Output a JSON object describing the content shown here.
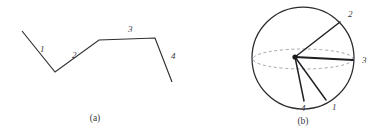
{
  "figure": {
    "background_color": "#ffffff",
    "stroke_color": "#2e2e33",
    "dashed_color": "#9b9ba3",
    "panels": [
      {
        "id": "panel-a",
        "caption": "(a)",
        "caption_x": 95,
        "caption_y": 121,
        "type": "polyline",
        "description": "Open polyline with four labelled segments forming a zigzag profile",
        "points": "22,31 55,72 99,40 155,38 172,82",
        "vertices": [
          {
            "x": 22,
            "y": 31
          },
          {
            "x": 55,
            "y": 72
          },
          {
            "x": 99,
            "y": 40
          },
          {
            "x": 155,
            "y": 38
          },
          {
            "x": 172,
            "y": 82
          }
        ],
        "segment_labels": [
          {
            "text": "1",
            "x": 40,
            "y": 52
          },
          {
            "text": "2",
            "x": 72,
            "y": 58
          },
          {
            "text": "3",
            "x": 128,
            "y": 32
          },
          {
            "text": "4",
            "x": 171,
            "y": 59
          }
        ]
      },
      {
        "id": "panel-b",
        "caption": "(b)",
        "caption_x": 303,
        "caption_y": 124,
        "type": "radial-sphere",
        "description": "Circle with dashed equatorial ellipse and four radiating labelled vectors from an off-centre hub",
        "circle": {
          "cx": 303,
          "cy": 58,
          "r": 51
        },
        "equator_ellipse": {
          "cx": 303,
          "cy": 59,
          "rx": 50,
          "ry": 10
        },
        "hub": {
          "x": 295,
          "y": 57,
          "radius": 2.6
        },
        "rays": [
          {
            "label": "1",
            "x1": 295,
            "y1": 57,
            "x2": 326,
            "y2": 100,
            "label_x": 332,
            "label_y": 110,
            "weight": "normal"
          },
          {
            "label": "2",
            "x1": 295,
            "y1": 57,
            "x2": 340,
            "y2": 22,
            "label_x": 348,
            "label_y": 17,
            "weight": "normal"
          },
          {
            "label": "3",
            "x1": 295,
            "y1": 57,
            "x2": 353,
            "y2": 60,
            "label_x": 362,
            "label_y": 63,
            "weight": "thick"
          },
          {
            "label": "4",
            "x1": 295,
            "y1": 57,
            "x2": 304,
            "y2": 101,
            "label_x": 301,
            "label_y": 111,
            "weight": "normal"
          }
        ]
      }
    ]
  }
}
